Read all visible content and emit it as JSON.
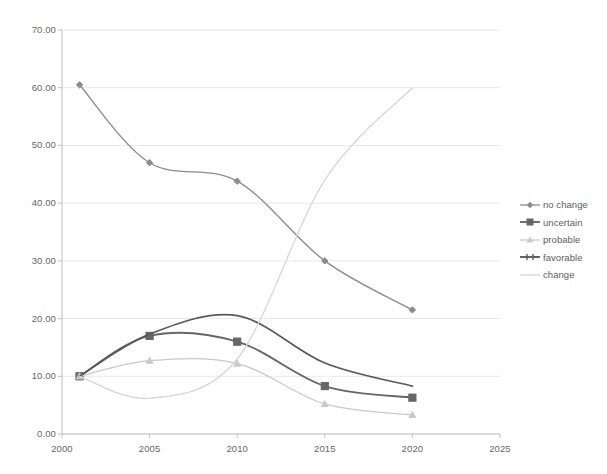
{
  "chart_data": {
    "type": "line",
    "title": "",
    "xlabel": "",
    "ylabel": "",
    "x": [
      2001,
      2005,
      2010,
      2015,
      2020
    ],
    "xlim": [
      2000,
      2025
    ],
    "ylim": [
      0,
      70
    ],
    "grid": true,
    "legend_position": "right",
    "x_ticks": [
      "2000",
      "2005",
      "2010",
      "2015",
      "2020",
      "2025"
    ],
    "y_ticks": [
      "0.00",
      "10.00",
      "20.00",
      "30.00",
      "40.00",
      "50.00",
      "60.00",
      "70.00"
    ],
    "series": [
      {
        "name": "no change",
        "values": [
          60.5,
          47.0,
          43.8,
          30.0,
          21.5
        ],
        "color": "#8c8c8c",
        "marker": "diamond",
        "width": 1.4,
        "smooth": true
      },
      {
        "name": "uncertain",
        "values": [
          10.0,
          17.0,
          16.0,
          8.3,
          6.3
        ],
        "color": "#666666",
        "marker": "square",
        "width": 1.9,
        "smooth": true
      },
      {
        "name": "probable",
        "values": [
          10.0,
          12.7,
          12.2,
          5.2,
          3.3
        ],
        "color": "#c9c9c9",
        "marker": "triangle",
        "width": 1.3,
        "smooth": true
      },
      {
        "name": "favorable",
        "values": [
          10.0,
          17.3,
          20.5,
          12.3,
          8.3
        ],
        "color": "#595959",
        "marker": "none",
        "width": 1.7,
        "smooth": true
      },
      {
        "name": "change",
        "values": [
          10.0,
          6.2,
          13.0,
          44.0,
          60.0
        ],
        "color": "#d6d6d6",
        "marker": "none",
        "width": 1.3,
        "smooth": true
      }
    ]
  },
  "axes": {
    "x_tick_labels": [
      "2000",
      "2005",
      "2010",
      "2015",
      "2020",
      "2025"
    ],
    "y_tick_labels": [
      "70.00",
      "60.00",
      "50.00",
      "40.00",
      "30.00",
      "20.00",
      "10.00",
      "0.00"
    ]
  },
  "legend": {
    "items": [
      {
        "label": "no change",
        "color": "#8c8c8c",
        "marker": "diamond"
      },
      {
        "label": "uncertain",
        "color": "#666666",
        "marker": "square"
      },
      {
        "label": "probable",
        "color": "#c9c9c9",
        "marker": "triangle"
      },
      {
        "label": "favorable",
        "color": "#595959",
        "marker": "tick"
      },
      {
        "label": "change",
        "color": "#d6d6d6",
        "marker": "none"
      }
    ]
  },
  "colors": {
    "grid": "#e8e8e8",
    "axis": "#c0c0c0",
    "text": "#666666",
    "background": "#ffffff"
  }
}
